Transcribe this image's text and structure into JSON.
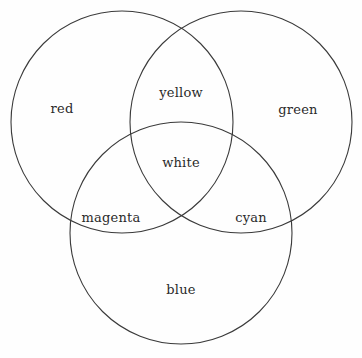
{
  "figure": {
    "background_color": "#fefefe",
    "stroke_color": "#3a3a3a",
    "text_color": "#2a2a2a",
    "width": 362,
    "height": 358
  },
  "chart_data": {
    "type": "venn",
    "title": "",
    "subtitle": "",
    "xlabel": "",
    "ylabel": "",
    "grid": false,
    "legend": "none",
    "set_count": 3,
    "fill": "none",
    "stroke_color": "#3a3a3a",
    "stroke_width": 1,
    "sets": [
      {
        "id": "red-set",
        "label": "red",
        "cx": 122,
        "cy": 122,
        "r": 111,
        "label_x": 62,
        "label_y": 108
      },
      {
        "id": "green-set",
        "label": "green",
        "cx": 241,
        "cy": 122,
        "r": 111,
        "label_x": 298,
        "label_y": 109
      },
      {
        "id": "blue-set",
        "label": "blue",
        "cx": 181,
        "cy": 233,
        "r": 111,
        "label_x": 181,
        "label_y": 289
      }
    ],
    "intersections": [
      {
        "id": "red-green",
        "label": "yellow",
        "sets": [
          "red",
          "green"
        ],
        "label_x": 181,
        "label_y": 92
      },
      {
        "id": "red-blue",
        "label": "magenta",
        "sets": [
          "red",
          "blue"
        ],
        "label_x": 111,
        "label_y": 217
      },
      {
        "id": "green-blue",
        "label": "cyan",
        "sets": [
          "green",
          "blue"
        ],
        "label_x": 251,
        "label_y": 217
      },
      {
        "id": "red-green-blue",
        "label": "white",
        "sets": [
          "red",
          "green",
          "blue"
        ],
        "label_x": 181,
        "label_y": 162
      }
    ],
    "labels": [
      "red",
      "yellow",
      "green",
      "white",
      "magenta",
      "cyan",
      "blue"
    ]
  }
}
